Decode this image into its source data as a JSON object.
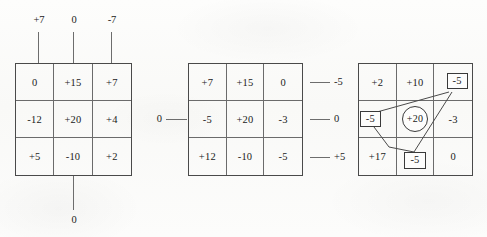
{
  "figure": {
    "title": "",
    "ink_color": "#1a1a1a",
    "rule_color": "#6b6b6b",
    "paper_color": "#fbfbfa"
  },
  "panels": [
    {
      "id": "panel-left",
      "name": "grid-left",
      "top_labels": [
        "+7",
        "0",
        "-7"
      ],
      "bottom_labels": [
        "0"
      ],
      "left_labels": [],
      "right_labels": [],
      "rows": [
        [
          "0",
          "+15",
          "+7"
        ],
        [
          "-12",
          "+20",
          "+4"
        ],
        [
          "+5",
          "-10",
          "+2"
        ]
      ],
      "annotations": []
    },
    {
      "id": "panel-middle",
      "name": "grid-middle",
      "top_labels": [],
      "bottom_labels": [],
      "left_labels": [
        "0"
      ],
      "right_labels": [
        "-5",
        "0",
        "+5"
      ],
      "rows": [
        [
          "+7",
          "+15",
          "0"
        ],
        [
          "-5",
          "+20",
          "-3"
        ],
        [
          "+12",
          "-10",
          "-5"
        ]
      ],
      "annotations": []
    },
    {
      "id": "panel-right",
      "name": "grid-right",
      "top_labels": [],
      "bottom_labels": [],
      "left_labels": [],
      "right_labels": [],
      "rows": [
        [
          "+2",
          "+10",
          "-5"
        ],
        [
          "-5",
          "+20",
          "-3"
        ],
        [
          "+17",
          "-5",
          "0"
        ]
      ],
      "marks": {
        "boxed_cells": [
          [
            0,
            2
          ],
          [
            1,
            0
          ],
          [
            2,
            1
          ]
        ],
        "circled_cells": [
          [
            1,
            1
          ]
        ],
        "connector_shape": "polygon linking the three boxed -5 cells around the circled +20"
      },
      "annotations": []
    }
  ]
}
